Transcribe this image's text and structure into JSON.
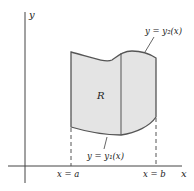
{
  "diagram": {
    "type": "region-between-curves",
    "axes": {
      "x_label": "x",
      "y_label": "y"
    },
    "region": {
      "label": "R",
      "fill": "#e4e4e4",
      "stroke": "#555555"
    },
    "curves": {
      "upper": {
        "label": "y = y₂(x)"
      },
      "lower": {
        "label": "y = y₁(x)"
      }
    },
    "bounds": {
      "left": {
        "label": "x = a"
      },
      "right": {
        "label": "x = b"
      }
    }
  }
}
